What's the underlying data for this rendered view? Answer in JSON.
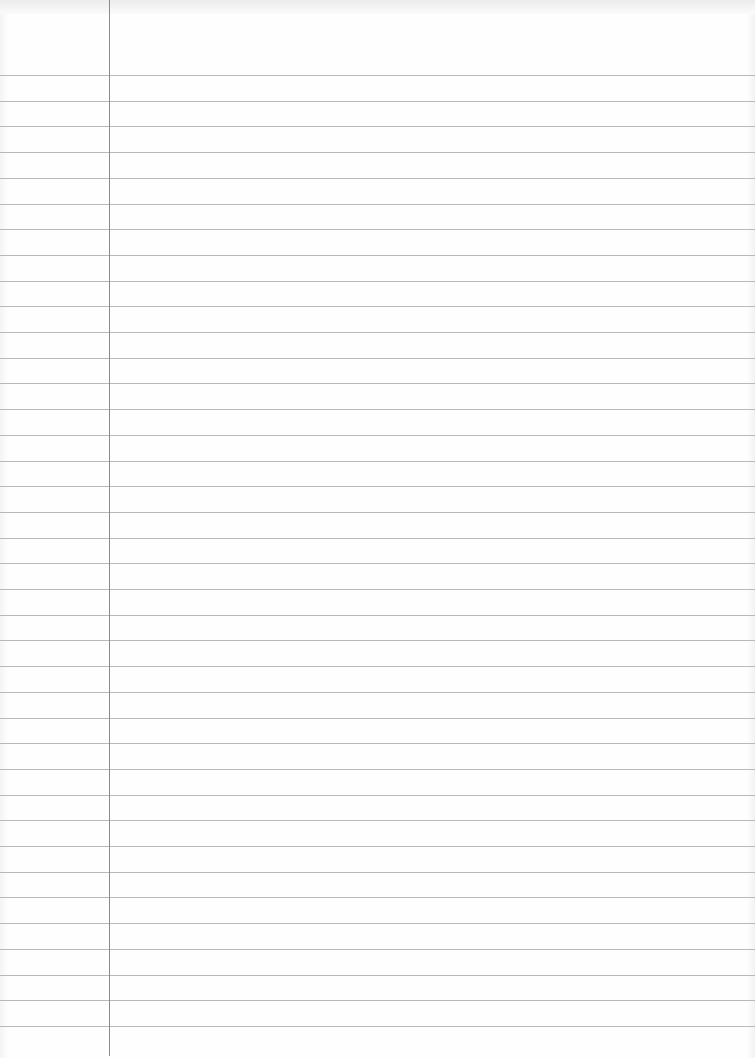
{
  "paper": {
    "type": "lined-paper",
    "width": 755,
    "height": 1058,
    "background_color": "#fdfdfd",
    "rule_color": "#b9b9b9",
    "margin_color": "#8c8c8c",
    "margin_x": 109,
    "first_rule_y": 75,
    "rule_spacing": 25.7,
    "rule_count": 38
  }
}
